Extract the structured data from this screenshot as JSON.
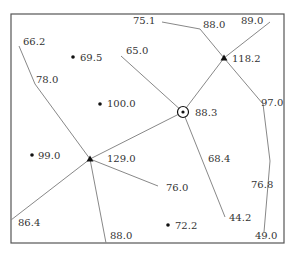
{
  "diagram": {
    "frame": {
      "x": 11,
      "y": 14,
      "w": 273,
      "h": 229
    },
    "colors": {
      "line": "#888888",
      "frame": "#555555",
      "text": "#333333",
      "marker": "#111111"
    },
    "lines": [
      {
        "id": "l-66",
        "points": [
          [
            19,
            46
          ],
          [
            35,
            84
          ],
          [
            90,
            159
          ]
        ]
      },
      {
        "id": "l-75",
        "points": [
          [
            162,
            22
          ],
          [
            200,
            29
          ],
          [
            224,
            58
          ],
          [
            263,
            104
          ],
          [
            270,
            161
          ],
          [
            264,
            232
          ]
        ]
      },
      {
        "id": "l-89",
        "points": [
          [
            270,
            22
          ],
          [
            224,
            58
          ],
          [
            183,
            112
          ]
        ]
      },
      {
        "id": "l-65",
        "points": [
          [
            121,
            56
          ],
          [
            183,
            112
          ]
        ]
      },
      {
        "id": "l-mid",
        "points": [
          [
            183,
            112
          ],
          [
            90,
            159
          ]
        ]
      },
      {
        "id": "l-76",
        "points": [
          [
            90,
            159
          ],
          [
            158,
            186
          ]
        ]
      },
      {
        "id": "l-86",
        "points": [
          [
            90,
            159
          ],
          [
            11,
            220
          ]
        ]
      },
      {
        "id": "l-88b",
        "points": [
          [
            90,
            159
          ],
          [
            106,
            243
          ]
        ]
      },
      {
        "id": "l-44",
        "points": [
          [
            183,
            112
          ],
          [
            225,
            217
          ]
        ]
      }
    ],
    "nodes": [
      {
        "id": "n-118",
        "type": "triangle",
        "x": 224,
        "y": 58,
        "label": "118.2"
      },
      {
        "id": "n-129",
        "type": "triangle",
        "x": 90,
        "y": 159,
        "label": "129.0"
      },
      {
        "id": "n-883",
        "type": "circle-dot",
        "x": 183,
        "y": 112,
        "label": "88.3"
      },
      {
        "id": "n-695",
        "type": "dot",
        "x": 73,
        "y": 57,
        "label": "69.5"
      },
      {
        "id": "n-100",
        "type": "dot",
        "x": 100,
        "y": 104,
        "label": "100.0"
      },
      {
        "id": "n-99",
        "type": "dot",
        "x": 32,
        "y": 155,
        "label": "99.0"
      },
      {
        "id": "n-722",
        "type": "dot",
        "x": 168,
        "y": 225,
        "label": "72.2"
      }
    ],
    "labels": [
      {
        "text": "75.1",
        "x": 133,
        "y": 16
      },
      {
        "text": "88.0",
        "x": 203,
        "y": 20
      },
      {
        "text": "89.0",
        "x": 241,
        "y": 16
      },
      {
        "text": "66.2",
        "x": 23,
        "y": 37
      },
      {
        "text": "69.5",
        "x": 80,
        "y": 53
      },
      {
        "text": "65.0",
        "x": 126,
        "y": 46
      },
      {
        "text": "118.2",
        "x": 232,
        "y": 54
      },
      {
        "text": "78.0",
        "x": 36,
        "y": 75
      },
      {
        "text": "100.0",
        "x": 107,
        "y": 99
      },
      {
        "text": "88.3",
        "x": 195,
        "y": 108
      },
      {
        "text": "97.0",
        "x": 261,
        "y": 98
      },
      {
        "text": "99.0",
        "x": 38,
        "y": 151
      },
      {
        "text": "129.0",
        "x": 107,
        "y": 154
      },
      {
        "text": "68.4",
        "x": 208,
        "y": 154
      },
      {
        "text": "76.0",
        "x": 166,
        "y": 183
      },
      {
        "text": "76.8",
        "x": 251,
        "y": 180
      },
      {
        "text": "86.4",
        "x": 18,
        "y": 218
      },
      {
        "text": "44.2",
        "x": 229,
        "y": 213
      },
      {
        "text": "72.2",
        "x": 175,
        "y": 221
      },
      {
        "text": "88.0",
        "x": 110,
        "y": 231
      },
      {
        "text": "49.0",
        "x": 255,
        "y": 231
      }
    ]
  }
}
